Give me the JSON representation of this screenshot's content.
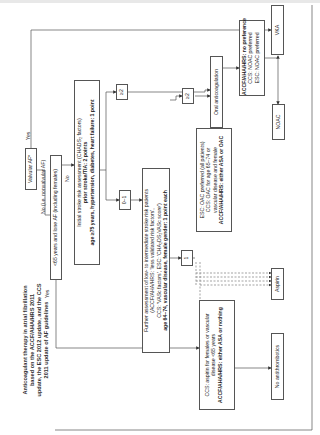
{
  "title": {
    "line1": "Anticoagulant therapy in atrial fibrillation",
    "line2": "based on the ACCF/AHA/HRS 2011",
    "line3": "update, the ESC 2012 update, and the CCS",
    "line4": "2011 update of AF guidelines"
  },
  "nodes": {
    "valvular": "Valvular AF*",
    "nonvalvular_label": "No (i.e. nonvalvular AF)",
    "lone_af": "<65 years and lone AF (including females)",
    "initial": {
      "line1": "Initial stroke risk assessment (CHADS₂ factors)",
      "line2": "prior stroke/TIA: 2 points",
      "line3": "age ≥75 years, hypertension, diabetes, heart failure: 1 point"
    },
    "ge2_a": "≥2",
    "zero_one": "0–1",
    "further": {
      "line1": "Further assessment of low- to intermediate stroke risk patients",
      "line2": "(ACCF/AHA/HRS: 'less validated risk factors',",
      "line3": "CCS: 'VASc factors', ESC: 'CHA₂DS₂VASc score')",
      "line4": "age 64–74, vascular disease, female gender: 1 point each"
    },
    "one": "1",
    "ge2_b": "≥2",
    "esc": {
      "line1": "ESC: OAC preferred (all patients)",
      "line2": "CCS: OAC for age 65–74 or",
      "line3": "vascular disease and female",
      "line4": "ACCF/AHA/HRS: either ASA or OAC"
    },
    "oral": "Oral anticoagulation",
    "nopref": {
      "line1": "ACCF/AHA/HRS: no preference",
      "line2": "CCS: NOAC preferred",
      "line3": "ESC: NOAC preferred"
    },
    "vka": "VKA",
    "noac": "NOAC",
    "aspirin": "Aspirin",
    "ccs": {
      "line1": "CCS: aspirin for females or vascular",
      "line2": "disease <65 years",
      "line3": "ACCF/AHA/HRS: either ASA or nothing"
    },
    "no_antithrombotics": "No antithrombotics"
  },
  "edge_labels": {
    "yes_top": "Yes",
    "no_mid": "No",
    "yes_bottom": "Yes"
  }
}
